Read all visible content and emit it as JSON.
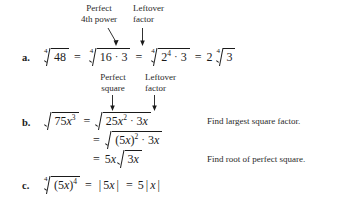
{
  "figure": {
    "type": "worked-examples",
    "callout_groups": [
      {
        "id": "group-a",
        "labels": [
          {
            "line1": "Perfect",
            "line2": "4th power"
          },
          {
            "line1": "Leftover",
            "line2": "factor"
          }
        ]
      },
      {
        "id": "group-b",
        "labels": [
          {
            "line1": "Perfect",
            "line2": "square"
          },
          {
            "line1": "Leftover",
            "line2": "factor"
          }
        ]
      }
    ],
    "items": [
      {
        "letter": "a.",
        "lines": [
          {
            "terms": [
              {
                "kind": "radical",
                "index": "4",
                "radicand": "48"
              },
              {
                "kind": "equals",
                "text": "="
              },
              {
                "kind": "radical",
                "index": "4",
                "radicand": "16 · 3"
              },
              {
                "kind": "equals",
                "text": "="
              },
              {
                "kind": "radical",
                "index": "4",
                "radicand": "2⁴ · 3"
              },
              {
                "kind": "equals",
                "text": "="
              },
              {
                "kind": "coef-radical",
                "coefficient": "2",
                "index": "4",
                "radicand": "3"
              }
            ],
            "note": ""
          }
        ]
      },
      {
        "letter": "b.",
        "lines": [
          {
            "terms": [
              {
                "kind": "radical",
                "index": "",
                "radicand": "75x³"
              },
              {
                "kind": "equals",
                "text": "="
              },
              {
                "kind": "radical",
                "index": "",
                "radicand": "25x² · 3x"
              }
            ],
            "note": "Find largest square factor."
          },
          {
            "terms": [
              {
                "kind": "equals",
                "text": "="
              },
              {
                "kind": "radical",
                "index": "",
                "radicand": "(5x)² · 3x"
              }
            ],
            "note": ""
          },
          {
            "terms": [
              {
                "kind": "equals",
                "text": "="
              },
              {
                "kind": "coef-radical",
                "coefficient": "5x",
                "index": "",
                "radicand": "3x"
              }
            ],
            "note": "Find root of perfect square."
          }
        ]
      },
      {
        "letter": "c.",
        "lines": [
          {
            "terms": [
              {
                "kind": "radical",
                "index": "4",
                "radicand": "(5x)⁴"
              },
              {
                "kind": "equals",
                "text": "="
              },
              {
                "kind": "abs",
                "text": "5x"
              },
              {
                "kind": "equals",
                "text": "="
              },
              {
                "kind": "coef-abs",
                "coefficient": "5",
                "text": "x"
              }
            ],
            "note": ""
          }
        ]
      }
    ],
    "numbers": {
      "n48": "48",
      "n16": "16",
      "n3": "3",
      "n2": "2",
      "n4": "4",
      "n75": "75",
      "n25": "25",
      "n5": "5"
    },
    "symbols": {
      "equals": "=",
      "dot": "·",
      "bar": "|"
    },
    "colors": {
      "ink": "#1a1a1a",
      "annotation": "#2a2a2a",
      "background": "#ffffff"
    }
  }
}
